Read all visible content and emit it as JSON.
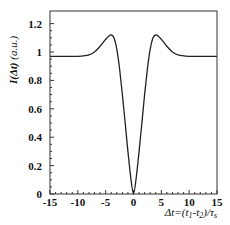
{
  "chart_data": {
    "type": "line",
    "title": "",
    "xlabel": "Δt=(t1-t2)/τs",
    "ylabel": "I(Δt) (a.u.)",
    "xlim": [
      -15,
      15
    ],
    "ylim": [
      0,
      1.25
    ],
    "x_ticks": [
      -15,
      -10,
      -5,
      0,
      5,
      10,
      15
    ],
    "y_ticks": [
      0,
      0.2,
      0.4,
      0.6,
      0.8,
      1,
      1.2
    ],
    "x_tick_labels": [
      "-15",
      "-10",
      "-5",
      "0",
      "5",
      "10",
      "15"
    ],
    "y_tick_labels": [
      "0",
      "0.2",
      "0.4",
      "0.6",
      "0.8",
      "1",
      "1.2"
    ],
    "grid": false,
    "legend": null,
    "series": [
      {
        "name": "I(Δt)",
        "color": "#222222",
        "x": [
          -15,
          -12,
          -10,
          -8,
          -7,
          -6,
          -5,
          -4.5,
          -4,
          -3.5,
          -3,
          -2.5,
          -2,
          -1.5,
          -1,
          -0.5,
          0,
          0.5,
          1,
          1.5,
          2,
          2.5,
          3,
          3.5,
          4,
          4.5,
          5,
          6,
          7,
          8,
          10,
          12,
          15
        ],
        "values": [
          0.97,
          0.97,
          0.97,
          0.98,
          1.0,
          1.04,
          1.09,
          1.11,
          1.12,
          1.1,
          1.02,
          0.88,
          0.7,
          0.5,
          0.3,
          0.12,
          0.0,
          0.12,
          0.3,
          0.5,
          0.7,
          0.88,
          1.02,
          1.1,
          1.12,
          1.11,
          1.09,
          1.04,
          1.0,
          0.98,
          0.97,
          0.97,
          0.97
        ]
      }
    ]
  },
  "labels": {
    "ylabel_main": "I(Δt)",
    "ylabel_units": " (a.u.)",
    "xlabel_prefix": "Δt=(t",
    "xlabel_sub1": "1",
    "xlabel_mid": "-t",
    "xlabel_sub2": "2",
    "xlabel_end": ")/τ",
    "xlabel_sub3": "s"
  }
}
